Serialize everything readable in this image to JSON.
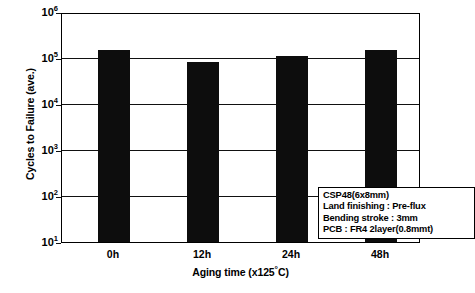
{
  "chart_data": {
    "type": "bar",
    "title": "",
    "xlabel": "Aging time (x125°C)",
    "ylabel": "Cycles to Failure (ave.)",
    "categories": [
      "0h",
      "12h",
      "24h",
      "48h"
    ],
    "values": [
      160000,
      90000,
      120000,
      160000
    ],
    "yscale": "log",
    "ylim": [
      10,
      1000000
    ],
    "ytick_labels": [
      "10⁶",
      "10⁵",
      "10⁴",
      "10³",
      "10²",
      "10¹"
    ],
    "ytick_values": [
      1000000,
      100000,
      10000,
      1000,
      100,
      10
    ],
    "grid": true,
    "grid_axis": "y",
    "legend_position": "inside-lower-right",
    "bar_color": "#0d0d0d",
    "annotations": [
      "CSP48(6x8mm)",
      "Land finishing : Pre-flux",
      "Bending stroke : 3mm",
      "PCB : FR4  2layer(0.8mmt)"
    ]
  },
  "axes": {
    "y_title": "Cycles to Failure (ave.)",
    "x_title_prefix": "Aging time (x125",
    "x_title_degree": "°",
    "x_title_suffix": "C)",
    "y_ticks": [
      {
        "mantissa": "10",
        "exponent": "6"
      },
      {
        "mantissa": "10",
        "exponent": "5"
      },
      {
        "mantissa": "10",
        "exponent": "4"
      },
      {
        "mantissa": "10",
        "exponent": "3"
      },
      {
        "mantissa": "10",
        "exponent": "2"
      },
      {
        "mantissa": "10",
        "exponent": "1"
      }
    ],
    "x_ticks": [
      "0h",
      "12h",
      "24h",
      "48h"
    ]
  },
  "legend": {
    "line1": "CSP48(6x8mm)",
    "line2": "Land finishing : Pre-flux",
    "line3": "Bending stroke : 3mm",
    "line4": "PCB : FR4  2layer(0.8mmt)"
  },
  "colors": {
    "bar": "#0d0d0d",
    "axis": "#000000",
    "grid": "#111111",
    "background": "#ffffff"
  }
}
